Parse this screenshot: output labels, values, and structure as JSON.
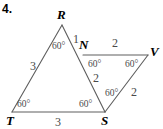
{
  "problem": {
    "number": "4."
  },
  "colors": {
    "stroke": "#5e5e5e",
    "stroke_light": "#8c8c8c",
    "text": "#000000",
    "label_gray": "#4a4a4a",
    "background": "#ffffff"
  },
  "figure": {
    "vertices": [
      {
        "name": "R",
        "label": "R",
        "x": 62,
        "y": 25,
        "label_x": 57,
        "label_y": 8
      },
      {
        "name": "T",
        "label": "T",
        "x": 12,
        "y": 112,
        "label_x": 6,
        "label_y": 114
      },
      {
        "name": "S",
        "label": "S",
        "x": 105,
        "y": 112,
        "label_x": 101,
        "label_y": 114
      },
      {
        "name": "N",
        "label": "N",
        "x": 83,
        "y": 55,
        "label_x": 79,
        "label_y": 38
      },
      {
        "name": "V",
        "label": "V",
        "x": 148,
        "y": 55,
        "label_x": 150,
        "label_y": 45
      }
    ],
    "segments": [
      {
        "name": "segment-RT",
        "from": "R",
        "to": "T"
      },
      {
        "name": "segment-TS",
        "from": "T",
        "to": "S"
      },
      {
        "name": "segment-RS",
        "from": "R",
        "to": "S"
      },
      {
        "name": "segment-NV",
        "from": "N",
        "to": "V"
      },
      {
        "name": "segment-VS",
        "from": "V",
        "to": "S"
      }
    ],
    "side_labels": [
      {
        "name": "side-label-RN",
        "text": "1",
        "x": 73,
        "y": 33
      },
      {
        "name": "side-label-RT",
        "text": "3",
        "x": 30,
        "y": 60
      },
      {
        "name": "side-label-TS",
        "text": "3",
        "x": 55,
        "y": 116
      },
      {
        "name": "side-label-NV",
        "text": "2",
        "x": 112,
        "y": 37
      },
      {
        "name": "side-label-NS",
        "text": "2",
        "x": 93,
        "y": 72
      },
      {
        "name": "side-label-SV",
        "text": "2",
        "x": 131,
        "y": 86
      }
    ],
    "angle_labels": [
      {
        "name": "angle-label-R",
        "text": "60°",
        "x": 52,
        "y": 42
      },
      {
        "name": "angle-label-T",
        "text": "60°",
        "x": 17,
        "y": 100
      },
      {
        "name": "angle-label-S-left",
        "text": "60°",
        "x": 79,
        "y": 100
      },
      {
        "name": "angle-label-N-right",
        "text": "60°",
        "x": 88,
        "y": 60
      },
      {
        "name": "angle-label-V",
        "text": "60°",
        "x": 125,
        "y": 60
      },
      {
        "name": "angle-label-S-top",
        "text": "60°",
        "x": 105,
        "y": 89
      }
    ]
  }
}
